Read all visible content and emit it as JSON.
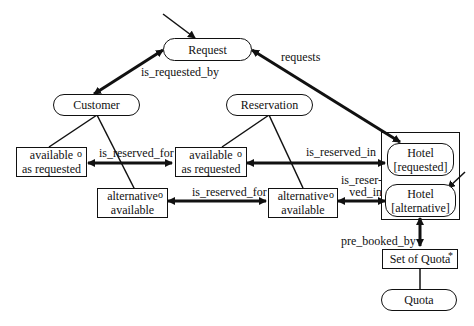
{
  "diagram": {
    "nodes": {
      "request": "Request",
      "customer": "Customer",
      "reservation": "Reservation",
      "cust_available_as_requested": [
        "available",
        "as requested"
      ],
      "cust_alternative_available": [
        "alternative",
        "available"
      ],
      "res_available_as_requested": [
        "available",
        "as requested"
      ],
      "res_alternative_available": [
        "alternative",
        "available"
      ],
      "hotel_requested": [
        "Hotel",
        "[requested]"
      ],
      "hotel_alternative": [
        "Hotel",
        "[alternative]"
      ],
      "set_of_quota": "Set of Quota",
      "quota": "Quota"
    },
    "markers": {
      "optional": "o",
      "multiple": "*"
    },
    "edges": {
      "is_requested_by": "is_requested_by",
      "requests": "requests",
      "is_reserved_for_1": "is_reserved_for",
      "is_reserved_for_2": "is_reserved_for",
      "is_reserved_in_1": "is_reserved_in",
      "is_reserved_in_2": [
        "is_reser-",
        "ved_in"
      ],
      "pre_booked_by": "pre_booked_by"
    }
  }
}
